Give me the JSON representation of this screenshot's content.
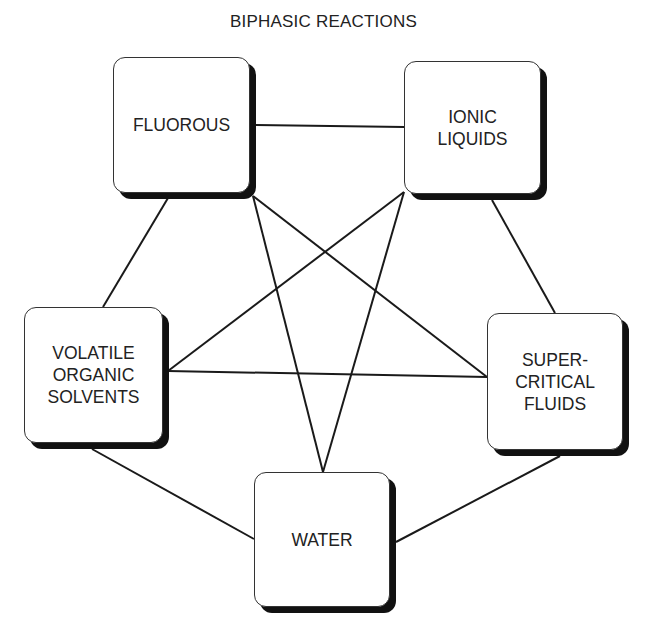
{
  "title": "BIPHASIC REACTIONS",
  "colors": {
    "line": "#1a1a1a",
    "shadow": "#111111",
    "box_fill": "#ffffff",
    "text": "#222222"
  },
  "nodes": [
    {
      "id": "fluorous",
      "label": "FLUOROUS",
      "x": 113,
      "y": 57,
      "w": 137,
      "h": 136
    },
    {
      "id": "ionic-liquids",
      "label": "IONIC\nLIQUIDS",
      "x": 404,
      "y": 61,
      "w": 137,
      "h": 133
    },
    {
      "id": "volatile-organic-solvents",
      "label": "VOLATILE\nORGANIC\nSOLVENTS",
      "x": 24,
      "y": 307,
      "w": 139,
      "h": 136
    },
    {
      "id": "supercritical-fluids",
      "label": "SUPER-\nCRITICAL\nFLUIDS",
      "x": 487,
      "y": 313,
      "w": 136,
      "h": 137
    },
    {
      "id": "water",
      "label": "WATER",
      "x": 254,
      "y": 472,
      "w": 136,
      "h": 135
    }
  ],
  "edges": [
    {
      "from": "fluorous",
      "to": "ionic-liquids",
      "x1": 256,
      "y1": 125,
      "x2": 404,
      "y2": 127
    },
    {
      "from": "fluorous",
      "to": "volatile-organic-solvents",
      "x1": 168,
      "y1": 198,
      "x2": 103,
      "y2": 307
    },
    {
      "from": "fluorous",
      "to": "water",
      "x1": 253,
      "y1": 196,
      "x2": 323,
      "y2": 472
    },
    {
      "from": "fluorous",
      "to": "supercritical-fluids",
      "x1": 253,
      "y1": 196,
      "x2": 487,
      "y2": 377
    },
    {
      "from": "ionic-liquids",
      "to": "volatile-organic-solvents",
      "x1": 404,
      "y1": 192,
      "x2": 168,
      "y2": 371
    },
    {
      "from": "ionic-liquids",
      "to": "water",
      "x1": 404,
      "y1": 192,
      "x2": 323,
      "y2": 472
    },
    {
      "from": "ionic-liquids",
      "to": "supercritical-fluids",
      "x1": 492,
      "y1": 200,
      "x2": 555,
      "y2": 313
    },
    {
      "from": "volatile-organic-solvents",
      "to": "supercritical-fluids",
      "x1": 168,
      "y1": 371,
      "x2": 487,
      "y2": 377
    },
    {
      "from": "volatile-organic-solvents",
      "to": "water",
      "x1": 92,
      "y1": 449,
      "x2": 254,
      "y2": 539
    },
    {
      "from": "supercritical-fluids",
      "to": "water",
      "x1": 560,
      "y1": 456,
      "x2": 396,
      "y2": 542
    }
  ]
}
